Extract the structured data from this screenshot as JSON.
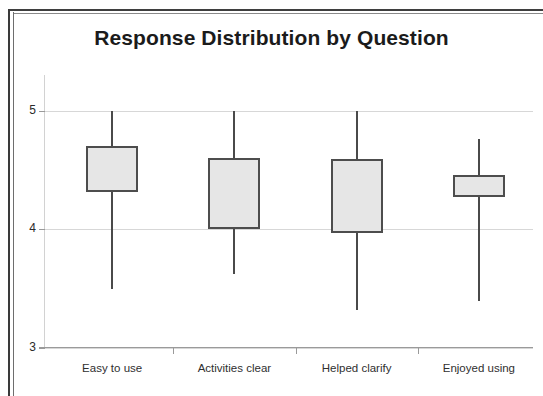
{
  "chart_data": {
    "type": "box",
    "title": "Response Distribution by Question",
    "xlabel": "",
    "ylabel": "",
    "grid": true,
    "legend": "none",
    "ylim": [
      3,
      5.3
    ],
    "yticks": [
      3,
      4,
      5
    ],
    "ytick_labels": [
      "3",
      "4",
      "5"
    ],
    "categories": [
      "Easy to use",
      "Activities clear",
      "Helped clarify",
      "Enjoyed using"
    ],
    "boxes": [
      {
        "category": "Easy to use",
        "whisker_high": 5.0,
        "box_top": 4.7,
        "box_bottom": 4.31,
        "whisker_low": 3.5
      },
      {
        "category": "Activities clear",
        "whisker_high": 5.0,
        "box_top": 4.6,
        "box_bottom": 4.0,
        "whisker_low": 3.62
      },
      {
        "category": "Helped clarify",
        "whisker_high": 5.0,
        "box_top": 4.59,
        "box_bottom": 3.97,
        "whisker_low": 3.32
      },
      {
        "category": "Enjoyed using",
        "whisker_high": 4.76,
        "box_top": 4.46,
        "box_bottom": 4.27,
        "whisker_low": 3.4
      }
    ],
    "colors": {
      "box_fill": "#e6e6e6",
      "box_border": "#4d4d4d",
      "whisker": "#4a4a4a",
      "gridline": "#d7d7d7",
      "axis": "#9a9a9a",
      "title_text": "#1b1b1b",
      "tick_text": "#2f2f2f",
      "frame": "#3a3a3a",
      "background": "#ffffff"
    }
  }
}
